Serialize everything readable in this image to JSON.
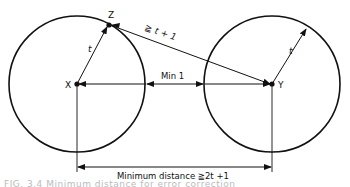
{
  "diagram": {
    "points": {
      "x": {
        "label": "X"
      },
      "y": {
        "label": "Y"
      },
      "z": {
        "label": "Z"
      }
    },
    "labels": {
      "radius_left": "t",
      "radius_right": "t",
      "zy_distance": "≧ t + 1",
      "gap": "Min 1",
      "minimum_distance": "Minimum distance ≧2t +1"
    },
    "colors": {
      "stroke": "#111111",
      "background": "#ffffff"
    }
  },
  "caption": {
    "text": "FIG. 3.4  Minimum distance for error correction"
  }
}
